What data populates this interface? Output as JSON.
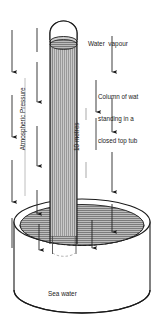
{
  "diagram": {
    "type": "physics-illustration",
    "colors": {
      "stroke": "#1a1a1a",
      "text": "#1a1a1a",
      "tube_fill": "#b4b4b4",
      "water_surface_fill": "#a8a8a8",
      "vessel_fill": "#ffffff",
      "background": "#ffffff"
    },
    "labels": {
      "water_vapour": "Water  vapour",
      "column_line1": "Column of wat",
      "column_line2": "standing in a",
      "column_line3": "closed top tub",
      "atmospheric_pressure": "Atmospheric Pressure",
      "ten_metres": "10 metres",
      "sea_water": "Sea water"
    },
    "elements": {
      "tube": {
        "name": "closed-top-tube",
        "left_x": 50,
        "right_x": 77,
        "top_y": 22,
        "bottom_y": 250,
        "closed_top": true,
        "fill": "vertical-hatch"
      },
      "water_surface_in_tube_y": 40,
      "vessel": {
        "name": "sea-water-vessel",
        "center_x": 82,
        "rim_y": 222,
        "base_y": 290,
        "rx": 68,
        "ry": 23
      }
    },
    "arrows": [
      {
        "name": "atmospheric-arrow-outer-left-1",
        "x": 12,
        "y1": 30,
        "y2": 72
      },
      {
        "name": "atmospheric-arrow-outer-left-2",
        "x": 12,
        "y1": 95,
        "y2": 137
      },
      {
        "name": "atmospheric-arrow-outer-left-3",
        "x": 12,
        "y1": 160,
        "y2": 202
      },
      {
        "name": "atmospheric-arrow-inner-left-1",
        "x": 37,
        "y1": 60,
        "y2": 100
      },
      {
        "name": "atmospheric-arrow-inner-left-2",
        "x": 37,
        "y1": 125,
        "y2": 165
      },
      {
        "name": "atmospheric-arrow-inner-left-3",
        "x": 37,
        "y1": 190,
        "y2": 228
      },
      {
        "name": "pressure-arrow-right-1",
        "x": 112,
        "y1": 42,
        "y2": 72
      },
      {
        "name": "pressure-arrow-right-2",
        "x": 112,
        "y1": 95,
        "y2": 132
      },
      {
        "name": "pressure-arrow-right-3",
        "x": 112,
        "y1": 150,
        "y2": 190
      },
      {
        "name": "pressure-arrow-right-4",
        "x": 112,
        "y1": 200,
        "y2": 232
      },
      {
        "name": "pressure-arrow-inner-right-1",
        "x": 96,
        "y1": 78,
        "y2": 110
      },
      {
        "name": "surface-arrow-left",
        "x": 39,
        "y1": 225,
        "y2": 252
      },
      {
        "name": "surface-arrow-right",
        "x": 92,
        "y1": 222,
        "y2": 250
      }
    ]
  }
}
